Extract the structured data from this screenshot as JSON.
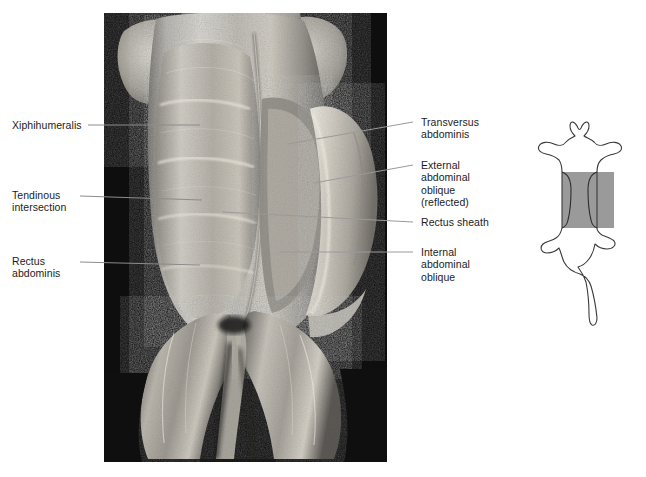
{
  "figure": {
    "kind": "anatomical-dissection-photograph",
    "view": "ventral view of abdominal wall musculature",
    "background_color": "#ffffff",
    "photo": {
      "name": "abdominal-wall-dissection-photo",
      "frame_color": "#040404",
      "x": 104,
      "y": 13,
      "width": 283,
      "height": 449,
      "tone": "grayscale"
    }
  },
  "labels": {
    "left": [
      {
        "id": "xiphihumeralis",
        "text": "Xiphihumeralis"
      },
      {
        "id": "tendinous-intersection",
        "text": "Tendinous\nintersection"
      },
      {
        "id": "rectus-abdominis",
        "text": "Rectus\nabdominis"
      }
    ],
    "right": [
      {
        "id": "transversus-abdominis",
        "text": "Transversus\nabdominis"
      },
      {
        "id": "external-abdominal-oblique",
        "text": "External\nabdominal\noblique\n(reflected)"
      },
      {
        "id": "rectus-sheath",
        "text": "Rectus sheath"
      },
      {
        "id": "internal-abdominal-oblique",
        "text": "Internal\nabdominal\noblique"
      }
    ]
  },
  "leaders": {
    "color": "#8c8c8c",
    "width": 1,
    "lines": [
      {
        "id": "leader-xiphihumeralis",
        "x1": 88,
        "y1": 125,
        "x2": 200,
        "y2": 125
      },
      {
        "id": "leader-tendinous-intersection",
        "x1": 80,
        "y1": 196,
        "x2": 202,
        "y2": 200
      },
      {
        "id": "leader-rectus-abdominis",
        "x1": 80,
        "y1": 262,
        "x2": 200,
        "y2": 265
      },
      {
        "id": "leader-transversus-abdominis",
        "x1": 413,
        "y1": 122,
        "x2": 288,
        "y2": 144
      },
      {
        "id": "leader-external-abdominal-oblique",
        "x1": 413,
        "y1": 165,
        "x2": 314,
        "y2": 183
      },
      {
        "id": "leader-rectus-sheath",
        "x1": 413,
        "y1": 222,
        "x2": 222,
        "y2": 212
      },
      {
        "id": "leader-internal-abdominal-oblique",
        "x1": 413,
        "y1": 252,
        "x2": 280,
        "y2": 252
      }
    ]
  },
  "orientation_icon": {
    "name": "cat-orientation-silhouette",
    "description": "ventral outline of a cat with the abdominal region highlighted",
    "outline_color": "#3a3a3a",
    "highlight_color": "#9a9a9a"
  }
}
